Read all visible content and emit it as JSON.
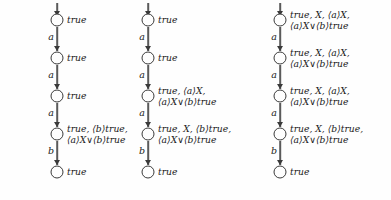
{
  "figure": {
    "type": "transition-system-diagrams",
    "columns": [
      {
        "id": "column-1",
        "x": 57,
        "nodes": [
          {
            "cy": 20,
            "label_lines": [
              "true"
            ]
          },
          {
            "cy": 58,
            "label_lines": [
              "true"
            ]
          },
          {
            "cy": 96,
            "label_lines": [
              "true"
            ]
          },
          {
            "cy": 134,
            "label_lines": [
              "true, ⟨b⟩true,",
              "⟨a⟩X∨⟨b⟩true"
            ]
          },
          {
            "cy": 172,
            "label_lines": [
              "true"
            ]
          }
        ],
        "edges": [
          {
            "from_cy": 20,
            "to_cy": 58,
            "label": "a"
          },
          {
            "from_cy": 58,
            "to_cy": 96,
            "label": "a"
          },
          {
            "from_cy": 96,
            "to_cy": 134,
            "label": "a"
          },
          {
            "from_cy": 134,
            "to_cy": 172,
            "label": "b"
          }
        ]
      },
      {
        "id": "column-2",
        "x": 148,
        "nodes": [
          {
            "cy": 20,
            "label_lines": [
              "true"
            ]
          },
          {
            "cy": 58,
            "label_lines": [
              "true"
            ]
          },
          {
            "cy": 96,
            "label_lines": [
              "true, ⟨a⟩X,",
              "⟨a⟩X∨⟨b⟩true"
            ]
          },
          {
            "cy": 134,
            "label_lines": [
              "true, X, ⟨b⟩true,",
              "⟨a⟩X∨⟨b⟩true"
            ]
          },
          {
            "cy": 172,
            "label_lines": [
              "true"
            ]
          }
        ],
        "edges": [
          {
            "from_cy": 20,
            "to_cy": 58,
            "label": "a"
          },
          {
            "from_cy": 58,
            "to_cy": 96,
            "label": "a"
          },
          {
            "from_cy": 96,
            "to_cy": 134,
            "label": "a"
          },
          {
            "from_cy": 134,
            "to_cy": 172,
            "label": "b"
          }
        ]
      },
      {
        "id": "column-3",
        "x": 280,
        "nodes": [
          {
            "cy": 20,
            "label_lines": [
              "true, X, ⟨a⟩X,",
              "⟨a⟩X∨⟨b⟩true"
            ]
          },
          {
            "cy": 58,
            "label_lines": [
              "true, X, ⟨a⟩X,",
              "⟨a⟩X∨⟨b⟩true"
            ]
          },
          {
            "cy": 96,
            "label_lines": [
              "true, X, ⟨a⟩X,",
              "⟨a⟩X∨⟨b⟩true"
            ]
          },
          {
            "cy": 134,
            "label_lines": [
              "true, X, ⟨b⟩true,",
              "⟨a⟩X∨⟨b⟩true"
            ]
          },
          {
            "cy": 172,
            "label_lines": [
              "true"
            ]
          }
        ],
        "edges": [
          {
            "from_cy": 20,
            "to_cy": 58,
            "label": "a"
          },
          {
            "from_cy": 58,
            "to_cy": 96,
            "label": "a"
          },
          {
            "from_cy": 96,
            "to_cy": 134,
            "label": "a"
          },
          {
            "from_cy": 134,
            "to_cy": 172,
            "label": "b"
          }
        ]
      }
    ],
    "colors": {
      "background": "#fefefe",
      "node_stroke": "#3a3a3a",
      "edge": "#5a5a5a",
      "text": "#1a1a1a"
    }
  }
}
